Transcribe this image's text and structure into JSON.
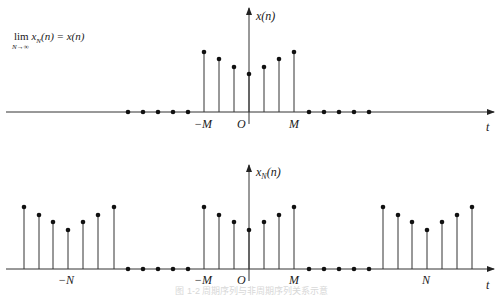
{
  "formula": {
    "text": "lim x_N(n) = x(n)",
    "lim": "lim",
    "subscript": "N→∞",
    "rhs_main": "x",
    "rhs_rest": "(n) = x(n)",
    "sub_n": "N"
  },
  "top_plot": {
    "ylabel": "x(n)",
    "xlabel": "t",
    "tick_labels": [
      "−M",
      "O",
      "M"
    ],
    "baseline_y": 112,
    "axis_x": 249,
    "axis_top": 8,
    "x_start": 6,
    "x_end": 494,
    "stems": [
      {
        "x": 204,
        "tip": 52
      },
      {
        "x": 219,
        "tip": 59
      },
      {
        "x": 234,
        "tip": 67
      },
      {
        "x": 249,
        "tip": 74
      },
      {
        "x": 264,
        "tip": 67
      },
      {
        "x": 279,
        "tip": 59
      },
      {
        "x": 294,
        "tip": 52
      }
    ],
    "zero_dots": [
      128,
      143,
      158,
      173,
      188,
      309,
      324,
      339,
      354,
      369
    ]
  },
  "bottom_plot": {
    "ylabel": "x_N(n)",
    "ylabel_main": "x",
    "ylabel_sub": "N",
    "ylabel_rest": "(n)",
    "xlabel": "t",
    "tick_labels": [
      "−N",
      "−M",
      "O",
      "M",
      "N"
    ],
    "baseline_y": 269,
    "axis_x": 249,
    "axis_top": 165,
    "x_start": 6,
    "x_end": 494,
    "stems": [
      {
        "x": 24,
        "tip": 207
      },
      {
        "x": 39,
        "tip": 215
      },
      {
        "x": 53,
        "tip": 222
      },
      {
        "x": 68,
        "tip": 230
      },
      {
        "x": 83,
        "tip": 222
      },
      {
        "x": 98,
        "tip": 215
      },
      {
        "x": 114,
        "tip": 207
      },
      {
        "x": 204,
        "tip": 207
      },
      {
        "x": 219,
        "tip": 215
      },
      {
        "x": 234,
        "tip": 222
      },
      {
        "x": 249,
        "tip": 230
      },
      {
        "x": 264,
        "tip": 222
      },
      {
        "x": 279,
        "tip": 215
      },
      {
        "x": 294,
        "tip": 207
      },
      {
        "x": 383,
        "tip": 207
      },
      {
        "x": 398,
        "tip": 215
      },
      {
        "x": 412,
        "tip": 222
      },
      {
        "x": 427,
        "tip": 230
      },
      {
        "x": 442,
        "tip": 222
      },
      {
        "x": 457,
        "tip": 215
      },
      {
        "x": 472,
        "tip": 207
      }
    ],
    "zero_dots": [
      128,
      143,
      158,
      173,
      188,
      309,
      324,
      339,
      354,
      369
    ]
  },
  "caption": "图 1-2 周期序列与非周期序列关系示意"
}
